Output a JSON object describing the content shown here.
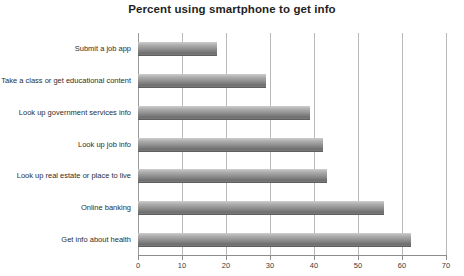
{
  "chart_data": {
    "type": "bar",
    "orientation": "horizontal",
    "title": "Percent using smartphone to get info",
    "xlabel": "",
    "ylabel": "",
    "categories": [
      "Submit a job app",
      "Take a class or get educational content",
      "Look up government services info",
      "Look up job info",
      "Look up real estate or place to live",
      "Online banking",
      "Get info about health"
    ],
    "values": [
      18,
      29,
      39,
      42,
      43,
      56,
      62
    ],
    "xlim": [
      0,
      70
    ],
    "xticks": [
      0,
      10,
      20,
      30,
      40,
      50,
      60,
      70
    ],
    "xtick_labels": [
      "0",
      "10",
      "20",
      "30",
      "40",
      "50",
      "60",
      "70"
    ],
    "grid": "vertical",
    "legend": "none",
    "bar_color": "#8f8f8f",
    "title_color": "#1f1f1f",
    "gridline_color": "#b8b8b8",
    "axis_color": "#8d8d8d"
  }
}
